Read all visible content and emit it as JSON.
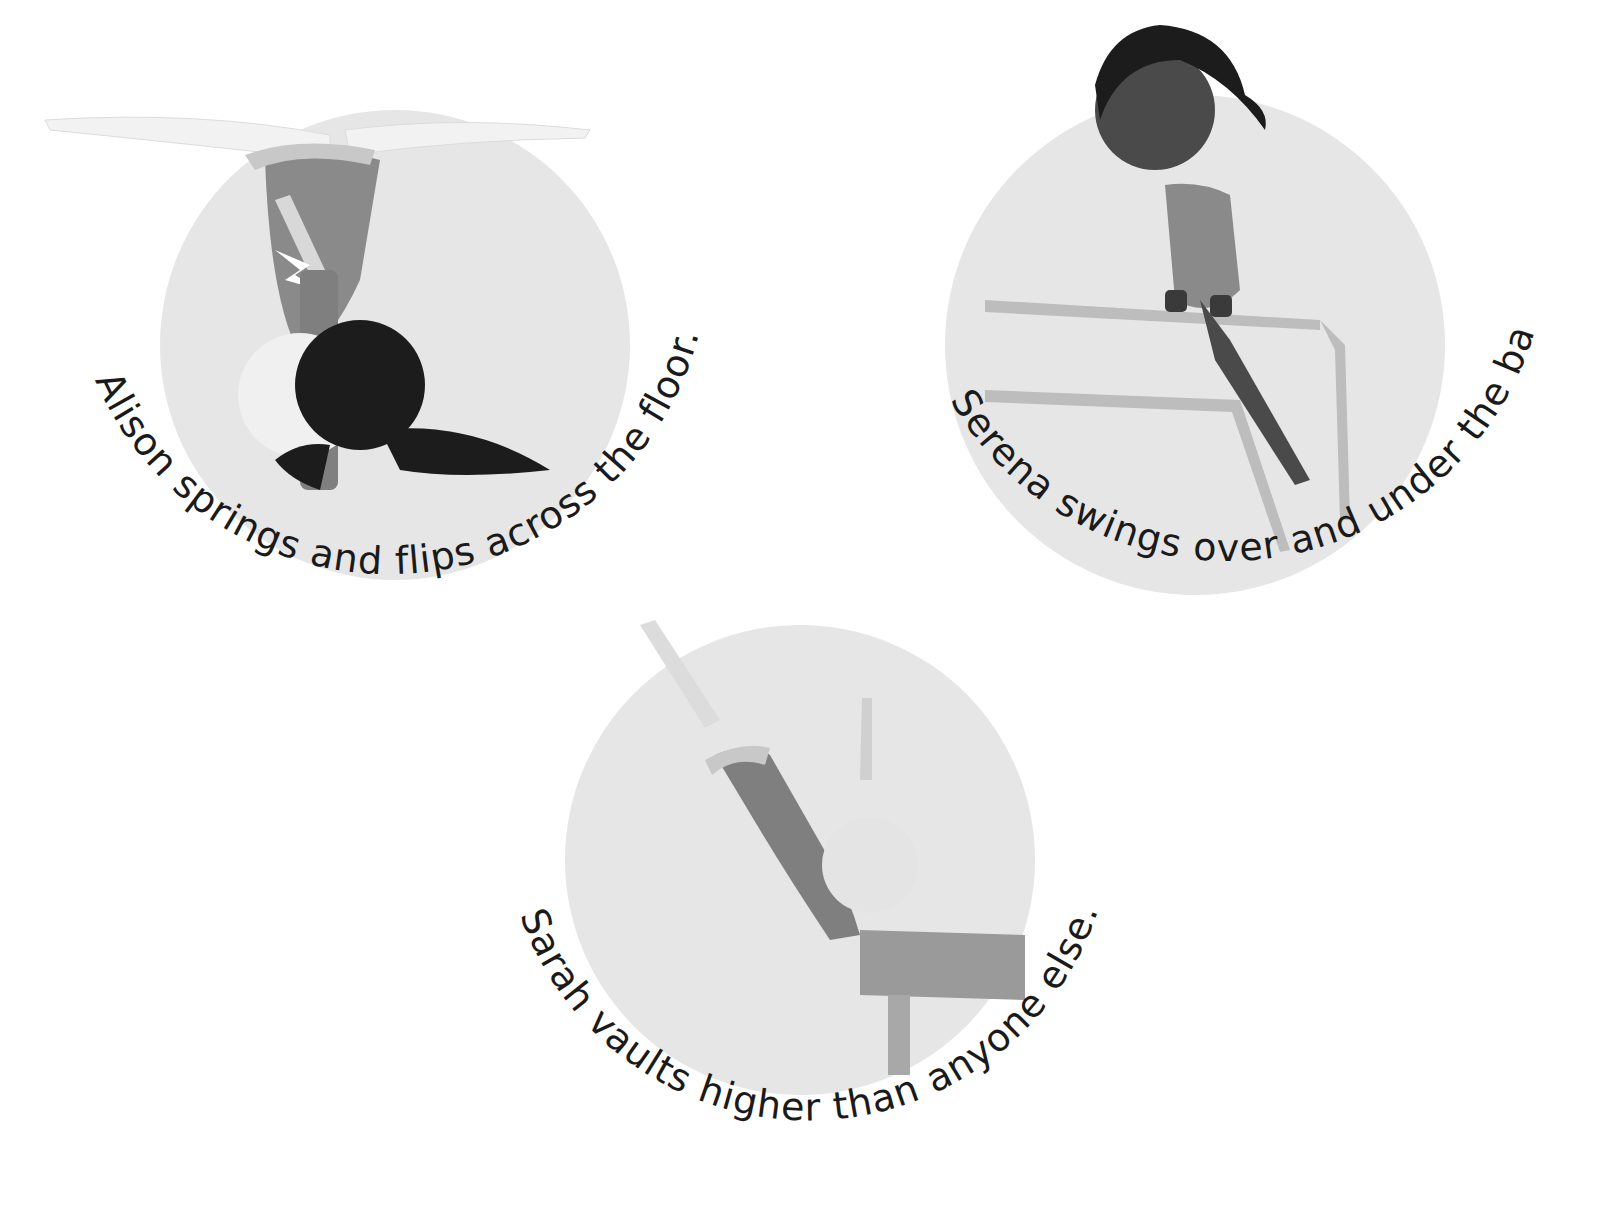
{
  "page": {
    "background": "#ffffff",
    "style": "grayscale children's book illustration"
  },
  "vignettes": [
    {
      "name": "alison",
      "caption": "Alison springs and flips across the floor.",
      "scene": "gymnast doing handstand / flip on floor",
      "circle": {
        "cx": 395,
        "cy": 340,
        "r": 235
      },
      "caption_radius": 310
    },
    {
      "name": "serena",
      "caption": "Serena swings over and under the bars.",
      "scene": "gymnast on uneven bars",
      "circle": {
        "cx": 1195,
        "cy": 330,
        "r": 250
      },
      "caption_radius": 315
    },
    {
      "name": "sarah",
      "caption": "Sarah vaults higher than anyone else.",
      "scene": "gymnast vaulting over vault table",
      "circle": {
        "cx": 800,
        "cy": 860,
        "r": 235
      },
      "caption_radius": 300
    }
  ],
  "colors": {
    "circle_fill": "#e8e8e8",
    "leotard": "#8a8a8a",
    "hair_dark": "#1c1c1c",
    "skin_light": "#ececec",
    "skin_dark": "#4a4a4a",
    "text": "#1a1a1a"
  }
}
